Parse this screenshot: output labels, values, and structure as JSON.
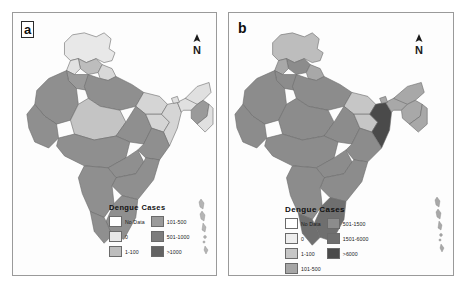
{
  "figure": {
    "background_color": "#ffffff",
    "panel_border_color": "#9a9a9a"
  },
  "panels": [
    {
      "id": "a",
      "letter": "a",
      "north_arrow_label": "N",
      "legend": {
        "title": "Dengue Cases",
        "columns": [
          {
            "items": [
              {
                "label": "No Data",
                "color": "#ffffff"
              },
              {
                "label": "0",
                "color": "#e8e8e8"
              },
              {
                "label": "1-100",
                "color": "#bdbdbd"
              }
            ]
          },
          {
            "items": [
              {
                "label": "101-500",
                "color": "#9a9a9a"
              },
              {
                "label": "501-1000",
                "color": "#7d7d7d"
              },
              {
                "label": ">1000",
                "color": "#636363"
              }
            ]
          }
        ]
      },
      "map": {
        "description": "Grayscale choropleth map of India, dengue cases by state",
        "regions": [
          {
            "name": "Jammu and Kashmir",
            "shade": "#e8e8e8"
          },
          {
            "name": "Himachal Pradesh",
            "shade": "#bdbdbd"
          },
          {
            "name": "Punjab",
            "shade": "#e2e2e2"
          },
          {
            "name": "Uttarakhand",
            "shade": "#d8d8d8"
          },
          {
            "name": "Haryana",
            "shade": "#9a9a9a"
          },
          {
            "name": "Rajasthan",
            "shade": "#8f8f8f"
          },
          {
            "name": "Uttar Pradesh",
            "shade": "#8f8f8f"
          },
          {
            "name": "Bihar",
            "shade": "#d5d5d5"
          },
          {
            "name": "Gujarat",
            "shade": "#8f8f8f"
          },
          {
            "name": "Madhya Pradesh",
            "shade": "#c4c4c4"
          },
          {
            "name": "Maharashtra",
            "shade": "#8f8f8f"
          },
          {
            "name": "Chhattisgarh",
            "shade": "#8f8f8f"
          },
          {
            "name": "Odisha",
            "shade": "#8f8f8f"
          },
          {
            "name": "West Bengal",
            "shade": "#d5d5d5"
          },
          {
            "name": "Jharkhand",
            "shade": "#d5d5d5"
          },
          {
            "name": "Telangana",
            "shade": "#8f8f8f"
          },
          {
            "name": "Andhra Pradesh",
            "shade": "#8f8f8f"
          },
          {
            "name": "Karnataka",
            "shade": "#8f8f8f"
          },
          {
            "name": "Kerala",
            "shade": "#8f8f8f"
          },
          {
            "name": "Tamil Nadu",
            "shade": "#8f8f8f"
          },
          {
            "name": "Assam and Northeast",
            "shade": "#e0e0e0"
          },
          {
            "name": "Andaman and Nicobar Islands",
            "shade": "#bdbdbd"
          }
        ]
      }
    },
    {
      "id": "b",
      "letter": "b",
      "north_arrow_label": "N",
      "legend": {
        "title": "Dengue Cases",
        "columns": [
          {
            "items": [
              {
                "label": "No Data",
                "color": "#ffffff"
              },
              {
                "label": "0",
                "color": "#ededed"
              },
              {
                "label": "1-100",
                "color": "#c6c6c6"
              },
              {
                "label": "101-500",
                "color": "#a6a6a6"
              }
            ]
          },
          {
            "items": [
              {
                "label": "501-1500",
                "color": "#8c8c8c"
              },
              {
                "label": "1501-6000",
                "color": "#6f6f6f"
              },
              {
                "label": ">6000",
                "color": "#4a4a4a"
              }
            ]
          }
        ]
      },
      "map": {
        "description": "Grayscale choropleth map of India, dengue cases by state",
        "regions": [
          {
            "name": "Jammu and Kashmir",
            "shade": "#bdbdbd"
          },
          {
            "name": "Himachal Pradesh",
            "shade": "#8c8c8c"
          },
          {
            "name": "Punjab",
            "shade": "#a8a8a8"
          },
          {
            "name": "Uttarakhand",
            "shade": "#a8a8a8"
          },
          {
            "name": "Haryana",
            "shade": "#8c8c8c"
          },
          {
            "name": "Rajasthan",
            "shade": "#8c8c8c"
          },
          {
            "name": "Uttar Pradesh",
            "shade": "#8c8c8c"
          },
          {
            "name": "Bihar",
            "shade": "#c6c6c6"
          },
          {
            "name": "Gujarat",
            "shade": "#8c8c8c"
          },
          {
            "name": "Madhya Pradesh",
            "shade": "#8c8c8c"
          },
          {
            "name": "Maharashtra",
            "shade": "#8c8c8c"
          },
          {
            "name": "Chhattisgarh",
            "shade": "#8c8c8c"
          },
          {
            "name": "Odisha",
            "shade": "#8c8c8c"
          },
          {
            "name": "West Bengal",
            "shade": "#4a4a4a"
          },
          {
            "name": "Jharkhand",
            "shade": "#c6c6c6"
          },
          {
            "name": "Telangana",
            "shade": "#8c8c8c"
          },
          {
            "name": "Andhra Pradesh",
            "shade": "#8c8c8c"
          },
          {
            "name": "Karnataka",
            "shade": "#8c8c8c"
          },
          {
            "name": "Kerala",
            "shade": "#6f6f6f"
          },
          {
            "name": "Tamil Nadu",
            "shade": "#6f6f6f"
          },
          {
            "name": "Assam and Northeast",
            "shade": "#a8a8a8"
          },
          {
            "name": "Andaman and Nicobar Islands",
            "shade": "#a8a8a8"
          }
        ]
      }
    }
  ]
}
